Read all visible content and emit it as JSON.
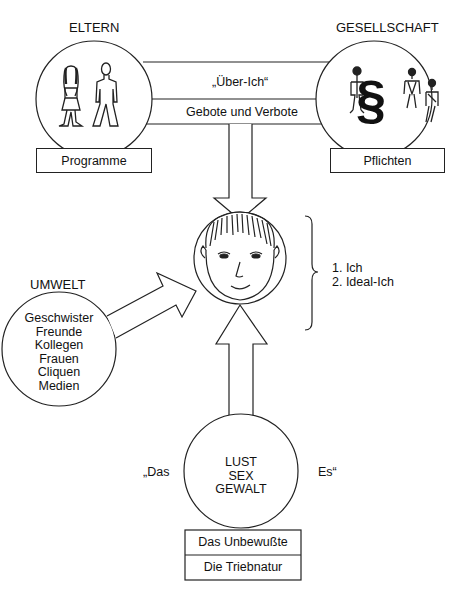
{
  "diagram": {
    "type": "psychoanalytic-model",
    "nodes": {
      "eltern": {
        "label": "ELTERN",
        "icon": "parents-figures-icon",
        "caption": "Programme"
      },
      "gesellschaft": {
        "label": "GESELLSCHAFT",
        "icon": "paragraph-law-icon",
        "caption": "Pflichten"
      },
      "ueber_ich": {
        "label": "„Über-Ich“",
        "sublabel": "Gebote und Verbote"
      },
      "ich": {
        "icon": "face-icon",
        "bracket_items": [
          "1. Ich",
          "2. Ideal-Ich"
        ]
      },
      "umwelt": {
        "label": "UMWELT",
        "items": [
          "Geschwister",
          "Freunde",
          "Kollegen",
          "Frauen",
          "Cliquen",
          "Medien"
        ]
      },
      "es": {
        "left_label": "„Das",
        "right_label": "Es“",
        "items": [
          "LUST",
          "SEX",
          "GEWALT"
        ],
        "captions": [
          "Das Unbewußte",
          "Die Triebnatur"
        ]
      }
    },
    "edges": [
      {
        "from": "ueber_ich",
        "to": "ich",
        "style": "hollow-arrow-down"
      },
      {
        "from": "umwelt",
        "to": "ich",
        "style": "hollow-arrow-diagonal"
      },
      {
        "from": "es",
        "to": "ich",
        "style": "hollow-arrow-up"
      }
    ],
    "colors": {
      "stroke": "#222222",
      "background": "#ffffff"
    }
  }
}
